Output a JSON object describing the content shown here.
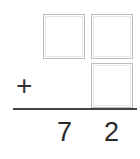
{
  "problem": {
    "operator": "+",
    "addend_top": {
      "tens": "",
      "ones": ""
    },
    "addend_bottom": {
      "ones": ""
    },
    "sum": {
      "tens": "7",
      "ones": "2"
    }
  },
  "colors": {
    "box_border": "#bdbdbd",
    "text": "#2a2a2a",
    "rule": "#444444"
  }
}
